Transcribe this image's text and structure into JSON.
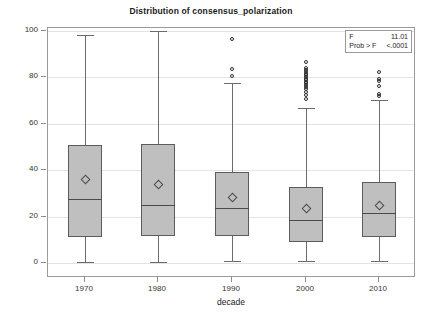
{
  "chart_data": {
    "type": "box",
    "title": "Distribution of consensus_polarization",
    "xlabel": "decade",
    "ylabel": "consensus_polarization",
    "ylim": [
      0,
      100
    ],
    "yticks": [
      0,
      20,
      40,
      60,
      80,
      100
    ],
    "ytick_labels": [
      "0",
      "20",
      "40",
      "60",
      "80",
      "100"
    ],
    "categories": [
      "1970",
      "1980",
      "1990",
      "2000",
      "2010"
    ],
    "grid": true,
    "legend": "none",
    "boxes": [
      {
        "category": "1970",
        "whisker_low": 0.3,
        "q1": 11.3,
        "median": 27.6,
        "q3": 50.8,
        "whisker_high": 98.1,
        "mean": 36.1,
        "outliers": []
      },
      {
        "category": "1980",
        "whisker_low": 0.4,
        "q1": 11.5,
        "median": 25.2,
        "q3": 51.5,
        "whisker_high": 100.0,
        "mean": 33.8,
        "outliers": []
      },
      {
        "category": "1990",
        "whisker_low": 0.7,
        "q1": 11.7,
        "median": 23.5,
        "q3": 39.1,
        "whisker_high": 77.6,
        "mean": 28.4,
        "outliers": [
          80.4,
          83.5,
          96.6
        ]
      },
      {
        "category": "2000",
        "whisker_low": 0.8,
        "q1": 9.0,
        "median": 18.6,
        "q3": 32.7,
        "whisker_high": 67.0,
        "mean": 23.3,
        "outliers": [
          70.6,
          72.4,
          73.8,
          75.1,
          76.0,
          76.8,
          77.5,
          78.2,
          78.9,
          79.5,
          80.2,
          80.9,
          81.6,
          82.4,
          83.2,
          84.1,
          86.7
        ]
      },
      {
        "category": "2010",
        "whisker_low": 1.0,
        "q1": 11.0,
        "median": 21.6,
        "q3": 35.1,
        "whisker_high": 70.1,
        "mean": 25.0,
        "outliers": [
          72.0,
          72.8,
          76.4,
          78.4,
          79.2,
          82.4
        ]
      }
    ]
  },
  "stats": {
    "f_label": "F",
    "f_value": "11.01",
    "prob_label": "Prob > F",
    "prob_value": "<.0001"
  },
  "colors": {
    "box_fill": "#bfbfbf",
    "box_edge": "#5c5c5c",
    "grid": "#e2e2ea",
    "frame": "#9a9a9a",
    "text": "#1a1a1a"
  }
}
